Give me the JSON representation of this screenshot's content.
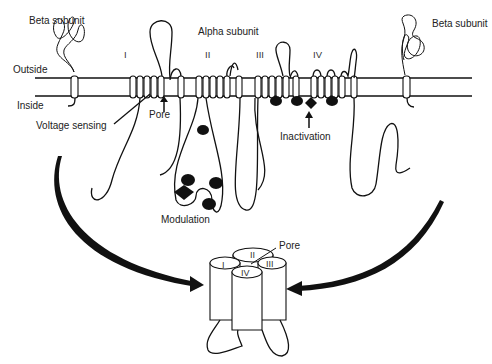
{
  "diagram": {
    "type": "membrane-protein-topology",
    "labels": {
      "beta_left": "Beta subunit",
      "beta_right": "Beta subunit",
      "alpha": "Alpha subunit",
      "outside": "Outside",
      "inside": "Inside",
      "voltage_sensing": "Voltage sensing",
      "pore_top": "Pore",
      "inactivation": "Inactivation",
      "modulation": "Modulation",
      "pore_bottom": "Pore"
    },
    "domains": [
      {
        "id": "I",
        "label": "I"
      },
      {
        "id": "II",
        "label": "II"
      },
      {
        "id": "III",
        "label": "III"
      },
      {
        "id": "IV",
        "label": "IV"
      }
    ],
    "assembled_channel": {
      "cylinders": [
        "I",
        "II",
        "III",
        "IV"
      ]
    },
    "colors": {
      "line": "#111111",
      "background": "#ffffff",
      "text": "#222222"
    }
  }
}
